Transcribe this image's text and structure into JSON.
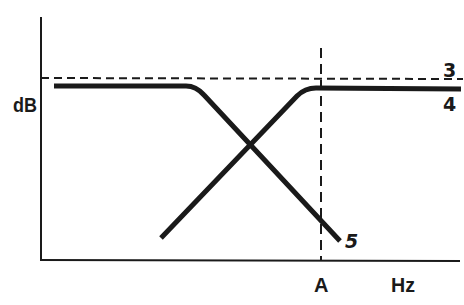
{
  "diagram": {
    "type": "frequency-response-sketch",
    "axes": {
      "y_label": "dB",
      "x_label": "Hz",
      "x_marker_label": "A"
    },
    "reference_lines": {
      "horizontal_dashed_label": "3",
      "vertical_dashed_at": "A"
    },
    "curves": [
      {
        "label": "4",
        "description": "high-pass response: rises with frequency, flat above A"
      },
      {
        "label": "5",
        "description": "low-pass response: flat at low frequency, rolls off toward A"
      }
    ],
    "colors": {
      "line": "#1a1a1a",
      "background": "#ffffff"
    }
  }
}
